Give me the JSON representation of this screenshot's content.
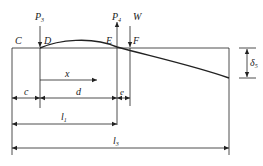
{
  "diagram": {
    "points": {
      "C": "C",
      "D": "D",
      "E": "E",
      "F": "F"
    },
    "loads": {
      "P3": {
        "sym": "P",
        "sub": "3",
        "direction": "down"
      },
      "P4": {
        "sym": "P",
        "sub": "4",
        "direction": "up"
      },
      "W": {
        "sym": "W",
        "direction": "down"
      }
    },
    "dimensions": {
      "x": "x",
      "c": "c",
      "d": "d",
      "e": "e",
      "l1": {
        "sym": "l",
        "sub": "1"
      },
      "l3": {
        "sym": "l",
        "sub": "3"
      },
      "delta5": {
        "sym": "δ",
        "sub": "5"
      }
    },
    "colors": {
      "line": "#222222",
      "background": "#ffffff"
    }
  }
}
